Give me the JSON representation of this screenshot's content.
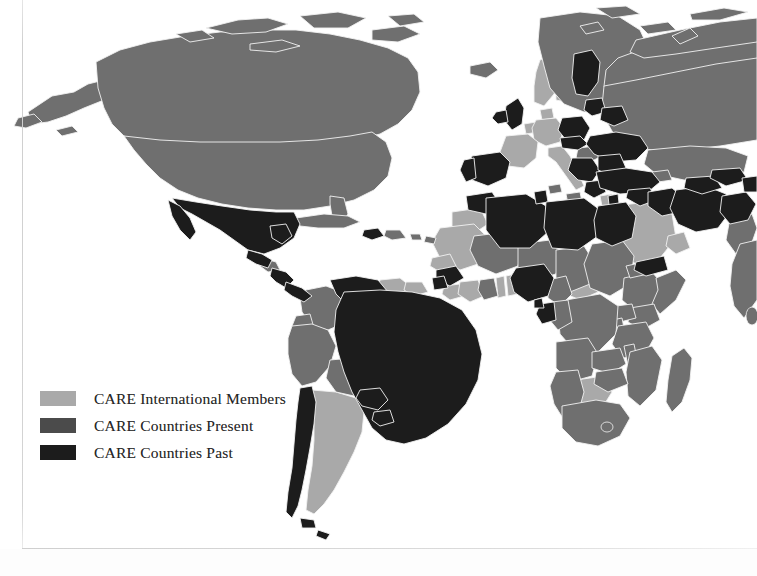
{
  "figure": {
    "type": "choropleth-world-map",
    "projection": "robinson",
    "background_color": "#ffffff",
    "border_color": "#d2d2d2",
    "country_outline_color": "#f2f2f2"
  },
  "legend": {
    "position": "bottom-left",
    "items": [
      {
        "label": "CARE International Members",
        "color": "#a9a9a9",
        "category": "members"
      },
      {
        "label": "CARE Countries Present",
        "color": "#4b4b4b",
        "category": "present"
      },
      {
        "label": "CARE Countries Past",
        "color": "#1c1c1c",
        "category": "past"
      }
    ]
  },
  "chart_data": {
    "type": "map",
    "title": "",
    "legend_position": "bottom-left",
    "categories": [
      "CARE International Members",
      "CARE Countries Present",
      "CARE Countries Past"
    ],
    "colors": {
      "members": "#a9a9a9",
      "present": "#6f6f6f",
      "past": "#1c1c1c",
      "ocean": "#ffffff",
      "border": "#f2f2f2"
    },
    "regions": [
      {
        "name": "Canada",
        "category": "present"
      },
      {
        "name": "United States",
        "category": "present"
      },
      {
        "name": "Greenland",
        "category": "present"
      },
      {
        "name": "Mexico",
        "category": "past"
      },
      {
        "name": "Guatemala",
        "category": "past"
      },
      {
        "name": "Honduras",
        "category": "present"
      },
      {
        "name": "El Salvador",
        "category": "past"
      },
      {
        "name": "Nicaragua",
        "category": "past"
      },
      {
        "name": "Costa Rica",
        "category": "past"
      },
      {
        "name": "Panama",
        "category": "past"
      },
      {
        "name": "Cuba",
        "category": "present"
      },
      {
        "name": "Haiti",
        "category": "past"
      },
      {
        "name": "Dominican Republic",
        "category": "present"
      },
      {
        "name": "Colombia",
        "category": "present"
      },
      {
        "name": "Venezuela",
        "category": "past"
      },
      {
        "name": "Guyana",
        "category": "members"
      },
      {
        "name": "Suriname",
        "category": "members"
      },
      {
        "name": "Ecuador",
        "category": "present"
      },
      {
        "name": "Peru",
        "category": "present"
      },
      {
        "name": "Bolivia",
        "category": "present"
      },
      {
        "name": "Brazil",
        "category": "past"
      },
      {
        "name": "Paraguay",
        "category": "past"
      },
      {
        "name": "Uruguay",
        "category": "past"
      },
      {
        "name": "Argentina",
        "category": "members"
      },
      {
        "name": "Chile",
        "category": "past"
      },
      {
        "name": "United Kingdom",
        "category": "past"
      },
      {
        "name": "Ireland",
        "category": "past"
      },
      {
        "name": "Norway",
        "category": "members"
      },
      {
        "name": "Sweden",
        "category": "members"
      },
      {
        "name": "Finland",
        "category": "past"
      },
      {
        "name": "Denmark",
        "category": "members"
      },
      {
        "name": "Netherlands",
        "category": "members"
      },
      {
        "name": "Germany",
        "category": "members"
      },
      {
        "name": "France",
        "category": "members"
      },
      {
        "name": "Austria",
        "category": "members"
      },
      {
        "name": "Spain",
        "category": "past"
      },
      {
        "name": "Portugal",
        "category": "past"
      },
      {
        "name": "Italy",
        "category": "members"
      },
      {
        "name": "Poland",
        "category": "past"
      },
      {
        "name": "Czechia",
        "category": "past"
      },
      {
        "name": "Romania",
        "category": "past"
      },
      {
        "name": "Bulgaria",
        "category": "past"
      },
      {
        "name": "Greece",
        "category": "past"
      },
      {
        "name": "Serbia",
        "category": "past"
      },
      {
        "name": "Croatia",
        "category": "present"
      },
      {
        "name": "Hungary",
        "category": "present"
      },
      {
        "name": "Ukraine",
        "category": "past"
      },
      {
        "name": "Belarus",
        "category": "past"
      },
      {
        "name": "Baltic States",
        "category": "past"
      },
      {
        "name": "Russia",
        "category": "present"
      },
      {
        "name": "Turkey",
        "category": "past"
      },
      {
        "name": "Georgia",
        "category": "present"
      },
      {
        "name": "Syria",
        "category": "past"
      },
      {
        "name": "Iraq",
        "category": "past"
      },
      {
        "name": "Iran",
        "category": "past"
      },
      {
        "name": "Saudi Arabia",
        "category": "members"
      },
      {
        "name": "Yemen",
        "category": "past"
      },
      {
        "name": "Oman",
        "category": "members"
      },
      {
        "name": "Kazakhstan",
        "category": "present"
      },
      {
        "name": "Uzbekistan",
        "category": "past"
      },
      {
        "name": "Turkmenistan",
        "category": "past"
      },
      {
        "name": "Kyrgyzstan",
        "category": "past"
      },
      {
        "name": "Tajikistan",
        "category": "past"
      },
      {
        "name": "Afghanistan",
        "category": "past"
      },
      {
        "name": "Pakistan",
        "category": "present"
      },
      {
        "name": "India",
        "category": "present"
      },
      {
        "name": "Nepal",
        "category": "past"
      },
      {
        "name": "Bangladesh",
        "category": "past"
      },
      {
        "name": "Morocco",
        "category": "past"
      },
      {
        "name": "Algeria",
        "category": "past"
      },
      {
        "name": "Tunisia",
        "category": "past"
      },
      {
        "name": "Libya",
        "category": "past"
      },
      {
        "name": "Egypt",
        "category": "past"
      },
      {
        "name": "Mauritania",
        "category": "members"
      },
      {
        "name": "Mali",
        "category": "present"
      },
      {
        "name": "Niger",
        "category": "present"
      },
      {
        "name": "Chad",
        "category": "present"
      },
      {
        "name": "Sudan",
        "category": "present"
      },
      {
        "name": "Senegal",
        "category": "members"
      },
      {
        "name": "Guinea",
        "category": "past"
      },
      {
        "name": "Sierra Leone",
        "category": "past"
      },
      {
        "name": "Liberia",
        "category": "members"
      },
      {
        "name": "Ivory Coast",
        "category": "members"
      },
      {
        "name": "Ghana",
        "category": "present"
      },
      {
        "name": "Togo",
        "category": "members"
      },
      {
        "name": "Benin",
        "category": "members"
      },
      {
        "name": "Nigeria",
        "category": "past"
      },
      {
        "name": "Cameroon",
        "category": "present"
      },
      {
        "name": "Central African Republic",
        "category": "members"
      },
      {
        "name": "Ethiopia",
        "category": "present"
      },
      {
        "name": "Somalia",
        "category": "present"
      },
      {
        "name": "Eritrea",
        "category": "present"
      },
      {
        "name": "Kenya",
        "category": "present"
      },
      {
        "name": "Uganda",
        "category": "present"
      },
      {
        "name": "Rwanda",
        "category": "present"
      },
      {
        "name": "Burundi",
        "category": "present"
      },
      {
        "name": "Tanzania",
        "category": "present"
      },
      {
        "name": "DR Congo",
        "category": "present"
      },
      {
        "name": "Congo",
        "category": "present"
      },
      {
        "name": "Gabon",
        "category": "past"
      },
      {
        "name": "Equatorial Guinea",
        "category": "past"
      },
      {
        "name": "Angola",
        "category": "present"
      },
      {
        "name": "Zambia",
        "category": "present"
      },
      {
        "name": "Malawi",
        "category": "present"
      },
      {
        "name": "Mozambique",
        "category": "present"
      },
      {
        "name": "Zimbabwe",
        "category": "present"
      },
      {
        "name": "Botswana",
        "category": "members"
      },
      {
        "name": "Namibia",
        "category": "present"
      },
      {
        "name": "South Africa",
        "category": "present"
      },
      {
        "name": "Lesotho",
        "category": "present"
      },
      {
        "name": "Madagascar",
        "category": "present"
      }
    ]
  }
}
